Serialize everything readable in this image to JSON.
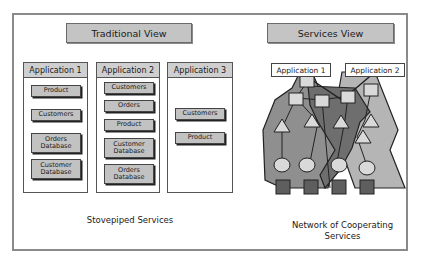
{
  "diagram": {
    "traditional": {
      "title": "Traditional View",
      "caption": "Stovepiped Services",
      "applications": [
        {
          "name": "Application 1",
          "services": [
            "Product",
            "Customers",
            "Orders\nDatabase",
            "Customer\nDatabase"
          ]
        },
        {
          "name": "Application 2",
          "services": [
            "Customers",
            "Orders",
            "Product",
            "Customer\nDatabase",
            "Orders\nDatabase"
          ]
        },
        {
          "name": "Application 3",
          "services": [
            "Customers",
            "Product"
          ]
        }
      ]
    },
    "services": {
      "title": "Services View",
      "caption": "Network of Cooperating\nServices",
      "application_labels": [
        "Application 1",
        "Application 2"
      ],
      "legend_shapes": {
        "square": "service component",
        "triangle": "business service",
        "circle": "data service",
        "dark-square": "data store"
      }
    },
    "colors": {
      "title_fill": "#c4c4c4",
      "service_fill": "#c2c2c2",
      "region_dark": "#6e6e6e",
      "region_mid": "#8f8f8f",
      "region_light": "#b5b5b5",
      "node_fill": "#d9d9d9",
      "store_fill": "#5e5e5e"
    }
  }
}
